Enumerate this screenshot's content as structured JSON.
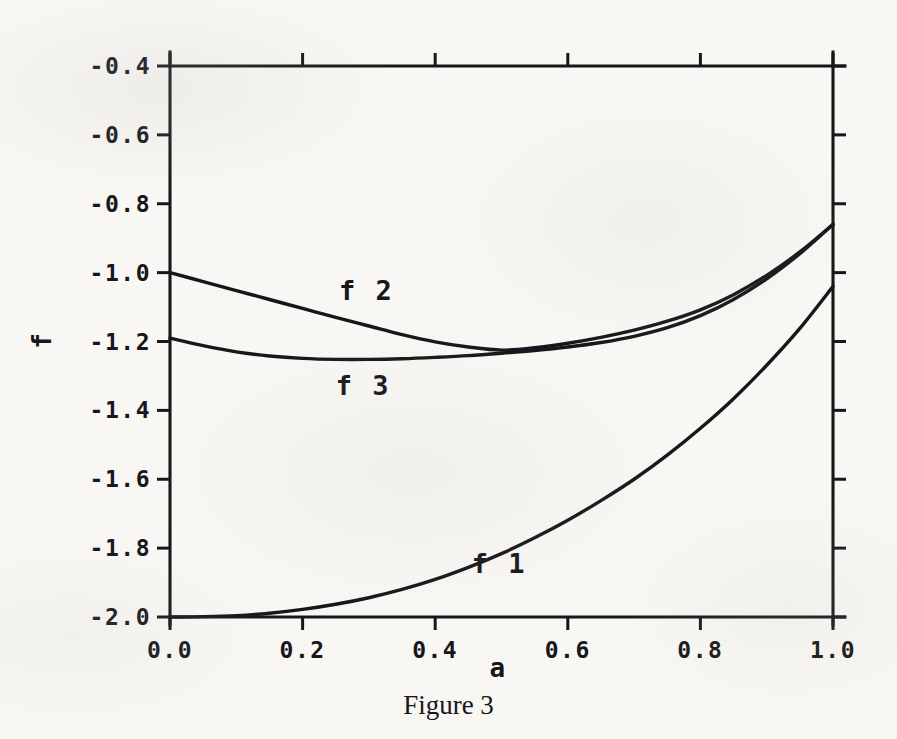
{
  "caption": "Figure 3",
  "chart_data": {
    "type": "line",
    "title": "",
    "xlabel": "a",
    "ylabel": "f",
    "xlim": [
      0.0,
      1.0
    ],
    "ylim": [
      -2.0,
      -0.4
    ],
    "grid": false,
    "legend": "inline-curve-labels",
    "xticks": [
      0.0,
      0.2,
      0.4,
      0.6,
      0.8,
      1.0
    ],
    "xtick_labels": [
      "0.0",
      "0.2",
      "0.4",
      "0.6",
      "0.8",
      "1.0"
    ],
    "yticks": [
      -0.4,
      -0.6,
      -0.8,
      -1.0,
      -1.2,
      -1.4,
      -1.6,
      -1.8,
      -2.0
    ],
    "ytick_labels": [
      "-0.4",
      "-0.6",
      "-0.8",
      "-1.0",
      "-1.2",
      "-1.4",
      "-1.6",
      "-1.8",
      "-2.0"
    ],
    "tick_direction": "out",
    "frame": "full-box",
    "x": [
      0.0,
      0.05,
      0.1,
      0.15,
      0.2,
      0.25,
      0.3,
      0.35,
      0.4,
      0.45,
      0.5,
      0.55,
      0.6,
      0.65,
      0.7,
      0.75,
      0.8,
      0.85,
      0.9,
      0.95,
      1.0
    ],
    "series": [
      {
        "name": "f 1",
        "label": "f 1",
        "label_x": 0.455,
        "label_y": -1.845,
        "values": [
          -2.0,
          -1.999,
          -1.996,
          -1.989,
          -1.978,
          -1.963,
          -1.944,
          -1.92,
          -1.891,
          -1.856,
          -1.816,
          -1.77,
          -1.719,
          -1.662,
          -1.6,
          -1.53,
          -1.452,
          -1.366,
          -1.269,
          -1.162,
          -1.04
        ]
      },
      {
        "name": "f 2",
        "label": "f 2",
        "label_x": 0.255,
        "label_y": -1.053,
        "values": [
          -1.0,
          -1.026,
          -1.052,
          -1.078,
          -1.104,
          -1.13,
          -1.155,
          -1.18,
          -1.201,
          -1.216,
          -1.225,
          -1.218,
          -1.205,
          -1.188,
          -1.167,
          -1.141,
          -1.108,
          -1.064,
          -1.008,
          -0.94,
          -0.86
        ]
      },
      {
        "name": "f 3",
        "label": "f 3",
        "label_x": 0.25,
        "label_y": -1.33,
        "values": [
          -1.19,
          -1.212,
          -1.23,
          -1.242,
          -1.249,
          -1.252,
          -1.252,
          -1.25,
          -1.246,
          -1.241,
          -1.234,
          -1.226,
          -1.216,
          -1.203,
          -1.185,
          -1.16,
          -1.125,
          -1.078,
          -1.018,
          -0.945,
          -0.86
        ]
      }
    ]
  },
  "geometry": {
    "left": 170,
    "right": 833,
    "top": 66,
    "bottom": 617,
    "tick_len_major": 13,
    "tick_len_minor": 13
  },
  "colors": {
    "ink": "#17161a",
    "paper": "#f8f7f4"
  }
}
